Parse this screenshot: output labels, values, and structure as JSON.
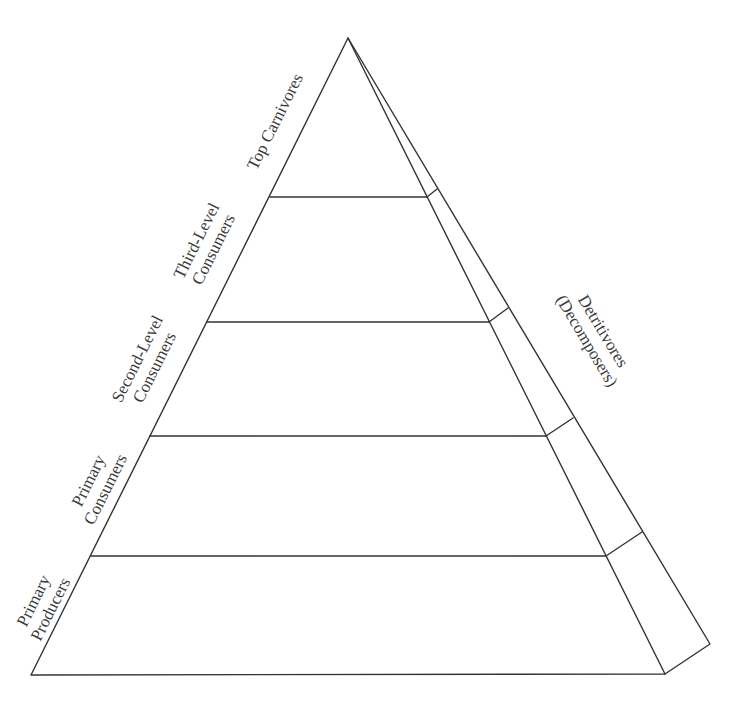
{
  "diagram": {
    "type": "ecological-pyramid",
    "line_color": "#333333",
    "text_color": "#3a3a3a",
    "apex": [
      348,
      38
    ],
    "base_front": [
      [
        31,
        675
      ],
      [
        665,
        674
      ]
    ],
    "base_back": [
      710,
      644
    ],
    "levels": [
      {
        "name": "Top Carnivores",
        "line1": "Top Carnivores",
        "line2": "",
        "divider_y": 197
      },
      {
        "name": "Third-Level Consumers",
        "line1": "Third-Level",
        "line2": "Consumers",
        "divider_y": 322
      },
      {
        "name": "Second-Level Consumers",
        "line1": "Second-Level",
        "line2": "Consumers",
        "divider_y": 436
      },
      {
        "name": "Primary Consumers",
        "line1": "Primary",
        "line2": "Consumers",
        "divider_y": 556
      },
      {
        "name": "Primary Producers",
        "line1": "Primary",
        "line2": "Producers",
        "divider_y": 675
      }
    ],
    "side_face": {
      "name": "Detritivores (Decomposers)",
      "line1": "Detritivores",
      "line2": "(Decomposers)"
    }
  }
}
